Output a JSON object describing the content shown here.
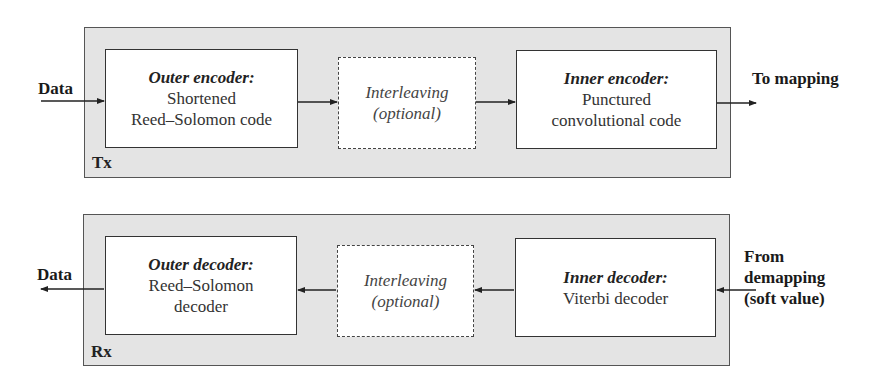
{
  "tx": {
    "panel_label": "Tx",
    "input_label": "Data",
    "output_label": "To mapping",
    "blocks": [
      {
        "title": "Outer encoder:",
        "lines": [
          "Shortened",
          "Reed–Solomon code"
        ],
        "style": "solid"
      },
      {
        "title": "Interleaving",
        "lines": [
          "(optional)"
        ],
        "style": "dashed"
      },
      {
        "title": "Inner encoder:",
        "lines": [
          "Punctured",
          "convolutional code"
        ],
        "style": "solid"
      }
    ]
  },
  "rx": {
    "panel_label": "Rx",
    "output_label": "Data",
    "input_label": [
      "From",
      "demapping",
      "(soft value)"
    ],
    "blocks": [
      {
        "title": "Outer decoder:",
        "lines": [
          "Reed–Solomon",
          "decoder"
        ],
        "style": "solid"
      },
      {
        "title": "Interleaving",
        "lines": [
          "(optional)"
        ],
        "style": "dashed"
      },
      {
        "title": "Inner decoder:",
        "lines": [
          "Viterbi decoder"
        ],
        "style": "solid"
      }
    ]
  },
  "colors": {
    "panel_fill": "#e4e4e4",
    "panel_border": "#555555",
    "box_fill": "#ffffff",
    "line": "#222222"
  }
}
